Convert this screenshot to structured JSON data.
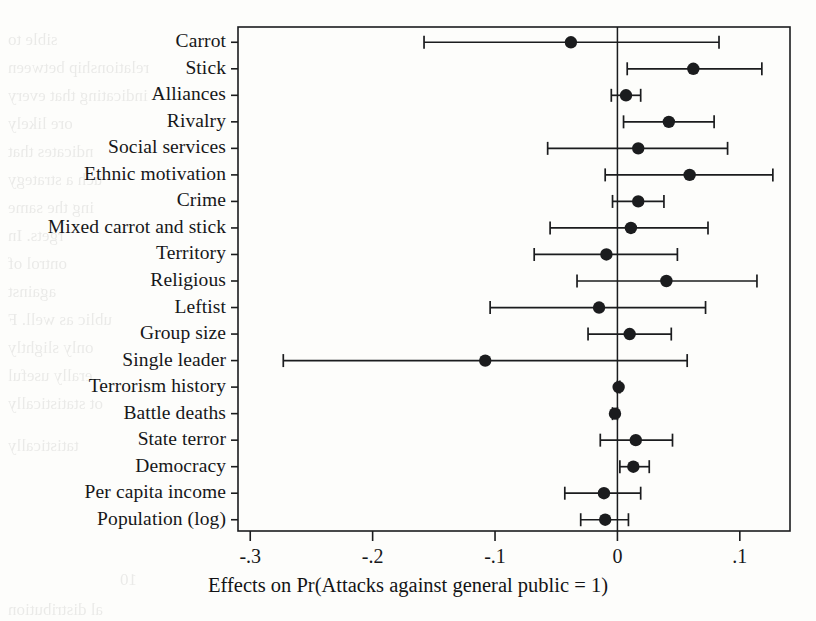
{
  "chart_data": {
    "type": "scatter",
    "title": "",
    "subtitle": "",
    "xlabel": "Effects on Pr(Attacks against general public = 1)",
    "ylabel": "",
    "xlim": [
      -0.31,
      0.141
    ],
    "xticks": [
      -0.3,
      -0.2,
      -0.1,
      0,
      0.1
    ],
    "xticklabels": [
      "-.3",
      "-.2",
      "-.1",
      "0",
      ".1"
    ],
    "grid": false,
    "legend": null,
    "reference_line": 0,
    "orientation": "horizontal",
    "marker": "filled-circle",
    "error_bars": "95% confidence interval (horizontal whiskers with end caps)",
    "categories": [
      "Carrot",
      "Stick",
      "Alliances",
      "Rivalry",
      "Social services",
      "Ethnic motivation",
      "Crime",
      "Mixed carrot and stick",
      "Territory",
      "Religious",
      "Leftist",
      "Group size",
      "Single leader",
      "Terrorism history",
      "Battle deaths",
      "State terror",
      "Democracy",
      "Per capita income",
      "Population (log)"
    ],
    "values": [
      -0.038,
      0.062,
      0.007,
      0.042,
      0.017,
      0.059,
      0.017,
      0.011,
      -0.009,
      0.04,
      -0.015,
      0.01,
      -0.108,
      0.001,
      -0.002,
      0.015,
      0.013,
      -0.011,
      -0.01
    ],
    "ci_low": [
      -0.158,
      0.008,
      -0.005,
      0.005,
      -0.057,
      -0.01,
      -0.004,
      -0.055,
      -0.068,
      -0.033,
      -0.104,
      -0.024,
      -0.273,
      0.0,
      -0.004,
      -0.014,
      0.002,
      -0.043,
      -0.03
    ],
    "ci_high": [
      0.083,
      0.118,
      0.019,
      0.079,
      0.09,
      0.127,
      0.038,
      0.074,
      0.049,
      0.114,
      0.072,
      0.044,
      0.057,
      0.002,
      0.0,
      0.045,
      0.026,
      0.019,
      0.009
    ]
  },
  "figure": {
    "caption": "Effects on Pr(Attacks against general public = 1)"
  },
  "ghost_text": [
    {
      "t": "sible to",
      "x": 8,
      "y": 30
    },
    {
      "t": "relationship between",
      "x": 8,
      "y": 58
    },
    {
      "t": "indicating that every",
      "x": 8,
      "y": 86
    },
    {
      "t": "ore likely",
      "x": 8,
      "y": 114
    },
    {
      "t": "ndicates that",
      "x": 8,
      "y": 142
    },
    {
      "t": "uch a strategy",
      "x": 8,
      "y": 170
    },
    {
      "t": "ing the same",
      "x": 8,
      "y": 198
    },
    {
      "t": "rgets. In",
      "x": 8,
      "y": 226
    },
    {
      "t": "ontrol of",
      "x": 8,
      "y": 254
    },
    {
      "t": "against",
      "x": 8,
      "y": 282
    },
    {
      "t": "ublic as well. F",
      "x": 8,
      "y": 310
    },
    {
      "t": "only slightly",
      "x": 8,
      "y": 338
    },
    {
      "t": "erally useful",
      "x": 8,
      "y": 366
    },
    {
      "t": "ot statistically",
      "x": 8,
      "y": 394
    },
    {
      "t": "tatistically",
      "x": 8,
      "y": 436
    },
    {
      "t": "10",
      "x": 120,
      "y": 570
    },
    {
      "t": "al distribution",
      "x": 8,
      "y": 600
    }
  ]
}
